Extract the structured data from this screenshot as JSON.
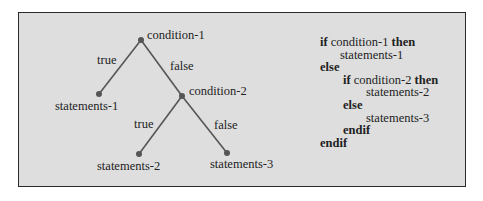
{
  "diagram": {
    "type": "decision-tree",
    "colors": {
      "background": "#dedede",
      "border": "#2a2a2a",
      "line": "#555555",
      "node": "#555555"
    },
    "nodes": [
      {
        "id": "c1",
        "label": "condition-1",
        "x": 141,
        "y": 40
      },
      {
        "id": "s1",
        "label": "statements-1",
        "x": 99,
        "y": 94
      },
      {
        "id": "c2",
        "label": "condition-2",
        "x": 182,
        "y": 96
      },
      {
        "id": "s2",
        "label": "statements-2",
        "x": 139,
        "y": 154
      },
      {
        "id": "s3",
        "label": "statements-3",
        "x": 227,
        "y": 153
      }
    ],
    "edges": [
      {
        "from": "c1",
        "to": "s1",
        "label": "true"
      },
      {
        "from": "c1",
        "to": "c2",
        "label": "false"
      },
      {
        "from": "c2",
        "to": "s2",
        "label": "true"
      },
      {
        "from": "c2",
        "to": "s3",
        "label": "false"
      }
    ]
  },
  "code": {
    "lines": [
      {
        "kw1": "if",
        "text": " condition-1 ",
        "kw2": "then"
      },
      {
        "text": "statements-1"
      },
      {
        "kw1": "else"
      },
      {
        "kw1": "if",
        "text": " condition-2 ",
        "kw2": "then"
      },
      {
        "text": "statements-2"
      },
      {
        "kw1": "else"
      },
      {
        "text": "statements-3"
      },
      {
        "kw1": "endif"
      },
      {
        "kw1": "endif"
      }
    ]
  }
}
